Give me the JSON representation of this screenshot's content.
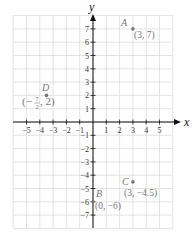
{
  "diagram": {
    "type": "coordinate-plane",
    "x_axis": {
      "label": "x",
      "ticks": [
        -5,
        -4,
        -3,
        -2,
        -1,
        1,
        2,
        3,
        4,
        5
      ],
      "grid_range": [
        -6,
        6
      ]
    },
    "y_axis": {
      "label": "y",
      "ticks": [
        7,
        6,
        5,
        4,
        3,
        2,
        1,
        -1,
        -2,
        -3,
        -4,
        -5,
        -6,
        -7
      ],
      "grid_range": [
        -8,
        8
      ]
    },
    "tick_labels": {
      "x": [
        "−5",
        "−4",
        "−3",
        "−2",
        "−1",
        "1",
        "2",
        "3",
        "4",
        "5"
      ],
      "y": [
        "7",
        "6",
        "5",
        "4",
        "3",
        "2",
        "1",
        "−1",
        "−2",
        "−3",
        "−4",
        "−5",
        "−6",
        "−7"
      ]
    },
    "points": [
      {
        "name": "A",
        "x": 3,
        "y": 7,
        "coord_label": "(3, 7)"
      },
      {
        "name": "B",
        "x": 0,
        "y": -6,
        "coord_label": "(0, −6)"
      },
      {
        "name": "C",
        "x": 3,
        "y": -4.5,
        "coord_label": "(3, −4.5)"
      },
      {
        "name": "D",
        "x": -3.5,
        "y": 2,
        "coord_label_prefix": "(−",
        "coord_label_frac_num": "7",
        "coord_label_frac_den": "2",
        "coord_label_suffix": ", 2)"
      }
    ],
    "colors": {
      "grid": "#dcdcdc",
      "axis": "#111111",
      "point": "#777777",
      "label": "#777777"
    }
  }
}
